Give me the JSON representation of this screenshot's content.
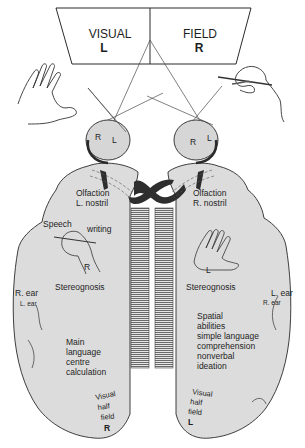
{
  "diagram": {
    "visual_field": {
      "left_label": "VISUAL",
      "left_side": "L",
      "right_label": "FIELD",
      "right_side": "R"
    },
    "eyes": {
      "left_eye": {
        "retina_labels": [
          "R",
          "L"
        ]
      },
      "right_eye": {
        "retina_labels": [
          "R",
          "L"
        ]
      }
    },
    "left_hemisphere": {
      "olfaction": [
        "Olfaction",
        "L. nostril"
      ],
      "speech": "Speech",
      "writing": "writing",
      "hand_label": "R",
      "stereognosis": "Stereognosis",
      "ear_primary": "R. ear",
      "ear_secondary": "L. ear",
      "functions": [
        "Main",
        "language",
        "centre",
        "calculation"
      ],
      "visual_half_field": [
        "Visual",
        "half",
        "field"
      ],
      "visual_half_field_side": "R"
    },
    "right_hemisphere": {
      "olfaction": [
        "Olfaction",
        "R. nostril"
      ],
      "hand_label": "L",
      "stereognosis": "Stereognosis",
      "ear_primary": "L. ear",
      "ear_secondary": "R. ear",
      "functions": [
        "Spatial",
        "abilities",
        "simple language",
        "comprehension",
        "nonverbal",
        "ideation"
      ],
      "visual_half_field": [
        "Visual",
        "half",
        "field"
      ],
      "visual_half_field_side": "L"
    },
    "colors": {
      "brain_fill": "#dcdcdc",
      "eye_fill": "#d6d6d6",
      "outline": "#2a2a2a",
      "tract_dark": "#2e2e2e",
      "callosum_stripes": "#6a6a6a"
    }
  }
}
